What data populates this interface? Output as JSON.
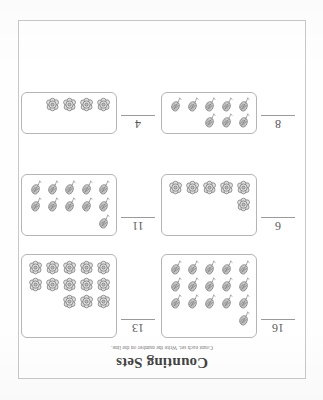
{
  "worksheet": {
    "title": "Counting Sets",
    "subtitle": "Count each set. Write the number on the line.",
    "orientation": "upside-down",
    "page_border_color": "#c8c8c8",
    "ink_color": "#3a3a3a"
  },
  "problems": [
    {
      "id": "problem-1",
      "answer": "16",
      "count": 16,
      "icon": "leaf-icon",
      "rows": [
        5,
        5,
        5,
        1
      ],
      "box_size": "h-big"
    },
    {
      "id": "problem-2",
      "answer": "13",
      "count": 13,
      "icon": "flower-icon",
      "rows": [
        5,
        5,
        3
      ],
      "box_size": "h-big"
    },
    {
      "id": "problem-3",
      "answer": "6",
      "count": 6,
      "icon": "flower-icon",
      "rows": [
        5,
        1
      ],
      "box_size": "h-mid"
    },
    {
      "id": "problem-4",
      "answer": "11",
      "count": 11,
      "icon": "leaf-icon",
      "rows": [
        5,
        5,
        1
      ],
      "box_size": "h-mid"
    },
    {
      "id": "problem-5",
      "answer": "8",
      "count": 8,
      "icon": "leaf-icon",
      "rows": [
        5,
        3
      ],
      "box_size": "h-sm"
    },
    {
      "id": "problem-6",
      "answer": "4",
      "count": 4,
      "icon": "flower-icon",
      "rows": [
        4
      ],
      "box_size": "h-sm"
    }
  ]
}
